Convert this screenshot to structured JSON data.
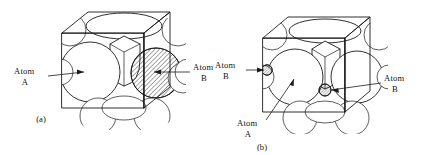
{
  "figure": {
    "background_color": "#ffffff",
    "line_color": "#1a1a1a",
    "hatch_color": "#1a1a1a"
  },
  "panels": [
    {
      "id": "a",
      "caption": "(a)",
      "type": "substitutional-solid-solution",
      "labels": [
        {
          "name": "atom-a-label",
          "line1": "Atom",
          "line2": "A",
          "side": "left",
          "points_to": "large-host-atom"
        },
        {
          "name": "atom-b-label",
          "line1": "Atom",
          "line2": "B",
          "side": "right",
          "points_to": "hatched-substitutional-atom"
        }
      ]
    },
    {
      "id": "b",
      "caption": "(b)",
      "type": "interstitial-solid-solution",
      "labels": [
        {
          "name": "atom-b-label-left",
          "line1": "Atom",
          "line2": "B",
          "side": "left",
          "points_to": "hatched-interstitial-atom-edge"
        },
        {
          "name": "atom-a-label",
          "line1": "Atom",
          "line2": "A",
          "side": "bottom-left",
          "points_to": "large-host-atom"
        },
        {
          "name": "atom-b-label-right",
          "line1": "Atom",
          "line2": "B",
          "side": "right",
          "points_to": "hatched-interstitial-atom-center"
        }
      ]
    }
  ]
}
